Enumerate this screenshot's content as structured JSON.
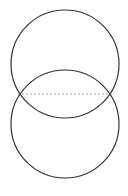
{
  "diagram": {
    "type": "two-overlapping-circles",
    "background": "#ffffff",
    "stroke_color": "#333333",
    "dash_color": "#8a8a8a",
    "shapes": [
      {
        "name": "top-circle",
        "cx": 65,
        "cy": 64,
        "r": 54
      },
      {
        "name": "bottom-circle",
        "cx": 65,
        "cy": 124,
        "r": 54
      }
    ],
    "chord": {
      "x1": 18,
      "y1": 94,
      "x2": 112,
      "y2": 94,
      "style": "dashed"
    }
  }
}
